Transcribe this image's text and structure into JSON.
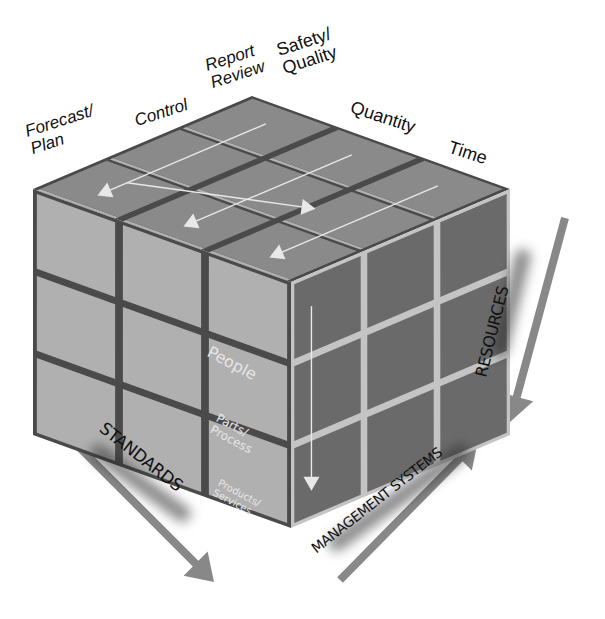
{
  "diagram": {
    "type": "3x3x3 isometric cube (Rubik-style) framework",
    "colors": {
      "background": "#ffffff",
      "top_face": "#8a8a8a",
      "left_face": "#b0b0b0",
      "right_face": "#6a6a6a",
      "gap_dark": "#4a4a4a",
      "gap_light": "#c4c4c4",
      "flow_line": "#e8e8e8",
      "axis_arrow": "#888888",
      "label_text": "#111111",
      "face_text": "#e6e6e6"
    }
  },
  "top_labels": [
    {
      "id": "forecast-plan",
      "text": "Forecast/\nPlan"
    },
    {
      "id": "control",
      "text": "Control"
    },
    {
      "id": "report-review",
      "text": "Report\nReview"
    },
    {
      "id": "safety-quality",
      "text": "Safety/\nQuality"
    },
    {
      "id": "quantity",
      "text": "Quantity"
    },
    {
      "id": "time",
      "text": "Time"
    }
  ],
  "front_face_labels": [
    {
      "id": "people",
      "text": "People"
    },
    {
      "id": "parts-process",
      "text": "Parts/\nProcess"
    },
    {
      "id": "products-services",
      "text": "Products/\nServices"
    }
  ],
  "axes": [
    {
      "id": "standards",
      "text": "STANDARDS",
      "direction": "down-right"
    },
    {
      "id": "management-systems",
      "text": "MANAGEMENT SYSTEMS",
      "direction": "up-right"
    },
    {
      "id": "resources",
      "text": "RESOURCES",
      "direction": "down"
    }
  ]
}
